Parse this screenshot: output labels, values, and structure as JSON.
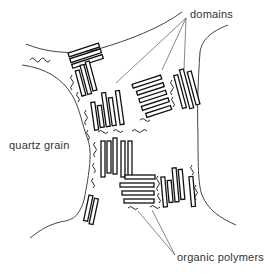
{
  "diagram": {
    "labels": {
      "domains": "domains",
      "quartz_grain": "quartz grain",
      "organic_polymers": "organic polymers"
    },
    "colors": {
      "background": "#ffffff",
      "stroke": "#111111",
      "text": "#333333"
    }
  }
}
